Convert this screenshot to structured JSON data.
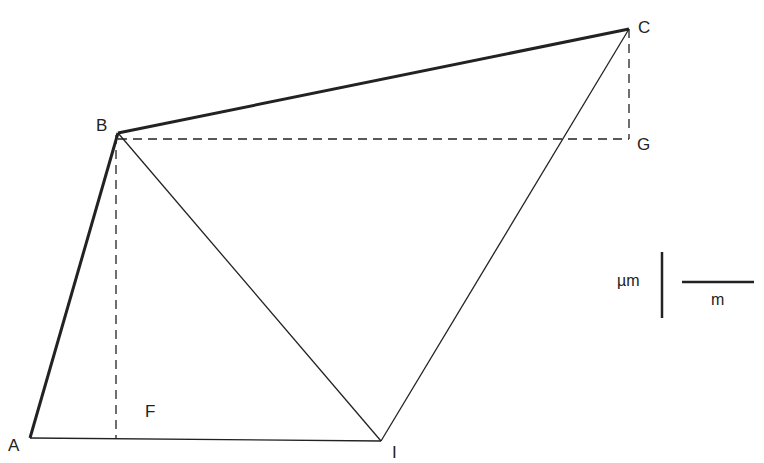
{
  "diagram": {
    "points": {
      "A": {
        "label": "A",
        "x": 30,
        "y": 438
      },
      "B": {
        "label": "B",
        "x": 118,
        "y": 133
      },
      "C": {
        "label": "C",
        "x": 629,
        "y": 29
      },
      "G": {
        "label": "G",
        "x": 629,
        "y": 139
      },
      "F": {
        "label": "F",
        "x": 116,
        "y": 438
      },
      "I": {
        "label": "I",
        "x": 381,
        "y": 441
      }
    },
    "thick_segments": [
      "A-B",
      "B-C"
    ],
    "thin_segments": [
      "A-I",
      "B-I",
      "C-I"
    ],
    "dashed_segments": [
      "B-G",
      "C-G",
      "B-F"
    ],
    "unit_legend": {
      "numerator": "µm",
      "denominator": "m"
    }
  }
}
